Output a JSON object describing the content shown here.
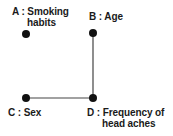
{
  "diagram": {
    "type": "undirected-graph",
    "colors": {
      "node": "#111111",
      "edge": "#444444",
      "text": "#1a1a1a",
      "background": "#ffffff"
    },
    "nodes": [
      {
        "id": "A",
        "label_line1": "A : Smoking",
        "label_line2": "habits",
        "x": 26,
        "y": 34
      },
      {
        "id": "B",
        "label_line1": "B : Age",
        "label_line2": "",
        "x": 93,
        "y": 33
      },
      {
        "id": "C",
        "label_line1": "C : Sex",
        "label_line2": "",
        "x": 26,
        "y": 98
      },
      {
        "id": "D",
        "label_line1": "D : Frequency of",
        "label_line2": "head aches",
        "x": 93,
        "y": 98
      }
    ],
    "edges": [
      {
        "from": "B",
        "to": "D"
      },
      {
        "from": "C",
        "to": "D"
      }
    ]
  }
}
